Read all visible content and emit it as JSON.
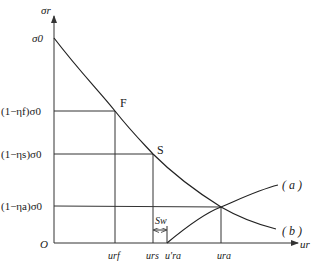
{
  "diagram": {
    "type": "ground-reaction-curve",
    "axes": {
      "y_label": "σr",
      "x_label": "ur",
      "origin_label": "O"
    },
    "y_ticks": [
      {
        "id": "sigma0",
        "label": "σ0"
      },
      {
        "id": "f",
        "label": "(1−ηf)σ0"
      },
      {
        "id": "s",
        "label": "(1−ηs)σ0"
      },
      {
        "id": "a",
        "label": "(1−ηa)σ0"
      }
    ],
    "x_ticks": [
      {
        "id": "urf",
        "label": "urf"
      },
      {
        "id": "urs",
        "label": "urs"
      },
      {
        "id": "ura_prime",
        "label": "u′ra"
      },
      {
        "id": "ura",
        "label": "ura"
      }
    ],
    "points": {
      "F": "F",
      "S": "S"
    },
    "annotation": {
      "sw": "Sw"
    },
    "curves": {
      "a": "( a )",
      "b": "( b )"
    },
    "colors": {
      "line": "#333333",
      "text": "#1a1a1a",
      "background": "#ffffff"
    }
  }
}
